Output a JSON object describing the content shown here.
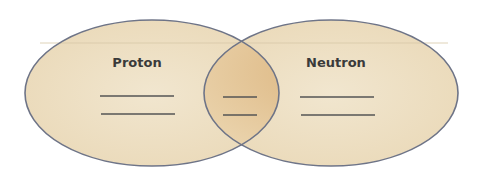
{
  "diagram": {
    "type": "venn",
    "sets": [
      {
        "id": "proton",
        "label": "Proton",
        "answer_lines": 2
      },
      {
        "id": "neutron",
        "label": "Neutron",
        "answer_lines": 2
      }
    ],
    "intersection": {
      "answer_lines": 2
    },
    "colors": {
      "fill": "#efe2c6",
      "intersection_fill": "#e2c08e",
      "outline": "#6e7487",
      "line": "#555555",
      "label": "#3a3a3a"
    }
  }
}
